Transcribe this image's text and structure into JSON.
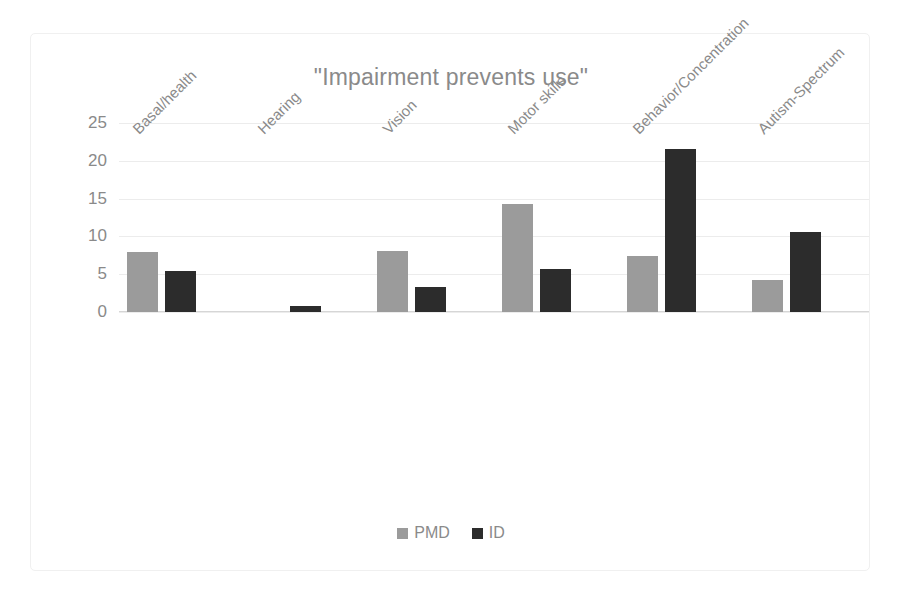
{
  "chart_data": {
    "type": "bar",
    "title": "\"Impairment prevents use\"",
    "xlabel": "",
    "ylabel": "",
    "ylim": [
      0,
      25
    ],
    "yticks": [
      0,
      5,
      10,
      15,
      20,
      25
    ],
    "grid": true,
    "legend_position": "bottom",
    "orientation": "vertical",
    "grouping": "grouped",
    "categories": [
      "Basal/health",
      "Hearing",
      "Vision",
      "Motor skills",
      "Behavior/Concentration",
      "Autism-Spectrum"
    ],
    "series": [
      {
        "name": "PMD",
        "color": "#9b9b9b",
        "values": [
          8.0,
          0,
          8.1,
          14.3,
          7.4,
          4.2
        ]
      },
      {
        "name": "ID",
        "color": "#2c2c2c",
        "values": [
          5.4,
          0.8,
          3.3,
          5.7,
          21.5,
          10.6
        ]
      }
    ]
  },
  "axis": {
    "ytick_labels": [
      "25",
      "20",
      "15",
      "10",
      "5",
      "0"
    ]
  },
  "legend": {
    "items": [
      {
        "label": "PMD",
        "color": "#9b9b9b"
      },
      {
        "label": "ID",
        "color": "#2c2c2c"
      }
    ]
  },
  "colors": {
    "pmd": "#9b9b9b",
    "id": "#2c2c2c",
    "text": "#8a8a8a",
    "gridline": "#ececec",
    "border": "#f0f0f0",
    "background": "#ffffff"
  }
}
